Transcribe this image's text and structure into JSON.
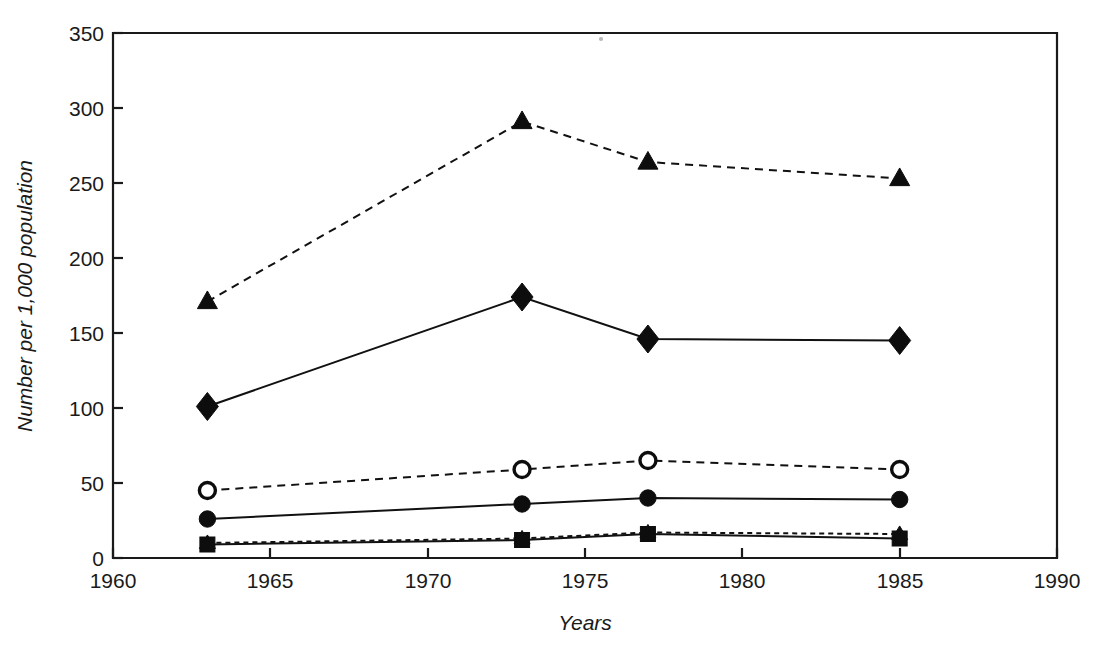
{
  "chart_data": {
    "type": "line",
    "title": "",
    "subtitle": "",
    "xlabel": "Years",
    "ylabel": "Number per 1,000 population",
    "xlim": [
      1960,
      1990
    ],
    "ylim": [
      0,
      350
    ],
    "xticks": [
      1960,
      1965,
      1970,
      1975,
      1980,
      1985,
      1990
    ],
    "yticks": [
      0,
      50,
      100,
      150,
      200,
      250,
      300,
      350
    ],
    "xtick_labels": [
      "1960",
      "1965",
      "1970",
      "1975",
      "1980",
      "1985",
      "1990"
    ],
    "ytick_labels": [
      "0",
      "50",
      "100",
      "150",
      "200",
      "250",
      "300",
      "350"
    ],
    "grid": false,
    "legend": "none",
    "x": [
      1963,
      1973,
      1977,
      1985
    ],
    "series": [
      {
        "name": "series-triangle-dashed",
        "marker": "filled-triangle",
        "linestyle": "dashed",
        "color": "#111111",
        "values": [
          171,
          291,
          264,
          253
        ]
      },
      {
        "name": "series-diamond-solid",
        "marker": "filled-diamond",
        "linestyle": "solid",
        "color": "#111111",
        "values": [
          101,
          174,
          146,
          145
        ]
      },
      {
        "name": "series-open-circle-dashed",
        "marker": "open-circle",
        "linestyle": "dashed",
        "color": "#111111",
        "values": [
          45,
          59,
          65,
          59
        ]
      },
      {
        "name": "series-filled-circle-solid",
        "marker": "filled-circle",
        "linestyle": "solid",
        "color": "#111111",
        "values": [
          26,
          36,
          40,
          39
        ]
      },
      {
        "name": "series-small-triangle-dashed",
        "marker": "filled-triangle-small",
        "linestyle": "dashed",
        "color": "#111111",
        "values": [
          10,
          13,
          17,
          16
        ]
      },
      {
        "name": "series-square-solid",
        "marker": "filled-square",
        "linestyle": "solid",
        "color": "#111111",
        "values": [
          9,
          12,
          16,
          13
        ]
      }
    ]
  },
  "axes": {
    "x_axis_title": "Years",
    "y_axis_title": "Number per 1,000 population"
  },
  "colors": {
    "ink": "#111111",
    "frame": "#1a1a1a",
    "background": "#ffffff"
  }
}
